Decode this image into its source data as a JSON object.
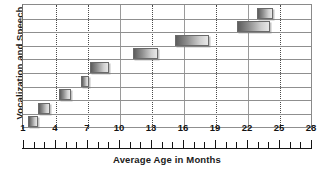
{
  "chart_data": {
    "type": "bar",
    "orientation": "horizontal",
    "title": "",
    "xlabel": "Average Age in Months",
    "ylabel": "Vocalization and Speech",
    "xlim": [
      1,
      28
    ],
    "xticks": [
      1,
      2,
      3,
      4,
      5,
      6,
      7,
      8,
      9,
      10,
      11,
      12,
      13,
      14,
      15,
      16,
      17,
      18,
      19,
      20,
      21,
      22,
      23,
      24,
      25,
      26,
      27,
      28
    ],
    "xtick_labels": [
      "1",
      "4",
      "7",
      "10",
      "13",
      "16",
      "19",
      "22",
      "25",
      "28"
    ],
    "xtick_label_values": [
      1,
      4,
      7,
      10,
      13,
      16,
      19,
      22,
      25,
      28
    ],
    "gridlines_vertical": [
      4,
      7,
      10,
      13,
      16,
      19,
      22,
      25
    ],
    "gridlines_vertical_solid": [
      10,
      16,
      22
    ],
    "grid": true,
    "legend": "none",
    "ytick_labels": [],
    "bar_color_left": "#5d5d5d",
    "bar_color_right": "#e8e8e8",
    "bars": [
      {
        "index": 1,
        "start": 1.4,
        "end": 2.3
      },
      {
        "index": 2,
        "start": 2.3,
        "end": 3.4
      },
      {
        "index": 3,
        "start": 4.3,
        "end": 5.4
      },
      {
        "index": 4,
        "start": 6.3,
        "end": 7.1
      },
      {
        "index": 5,
        "start": 7.2,
        "end": 9.0
      },
      {
        "index": 6,
        "start": 11.2,
        "end": 13.6
      },
      {
        "index": 7,
        "start": 15.2,
        "end": 18.3
      },
      {
        "index": 8,
        "start": 21.0,
        "end": 24.1
      },
      {
        "index": 9,
        "start": 22.8,
        "end": 24.3
      }
    ],
    "row_lines": 9
  }
}
